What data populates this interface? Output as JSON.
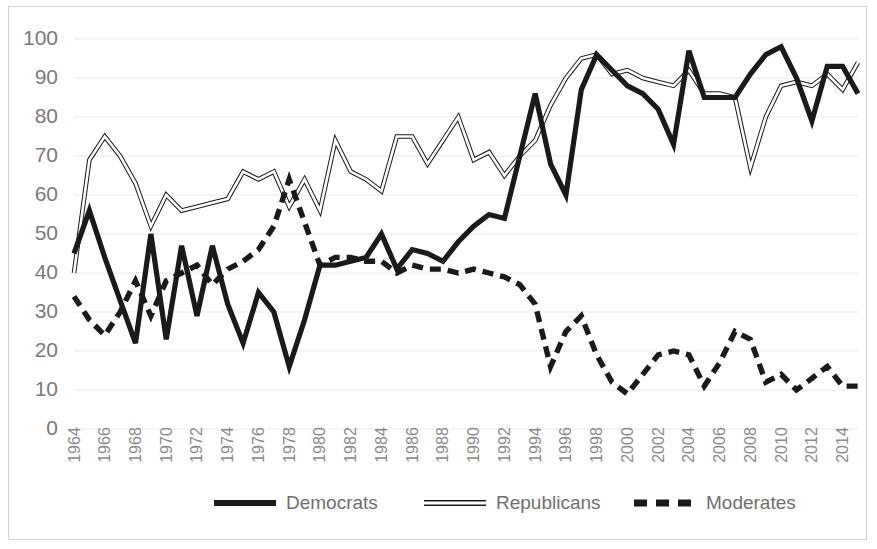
{
  "chart_data": {
    "type": "line",
    "title": "",
    "subtitle": "",
    "xlabel": "",
    "ylabel": "",
    "xlim": [
      1964,
      2015
    ],
    "ylim": [
      0,
      100
    ],
    "grid": true,
    "legend_position": "bottom",
    "y_ticks": [
      0,
      10,
      20,
      30,
      40,
      50,
      60,
      70,
      80,
      90,
      100
    ],
    "x_tick_labels": [
      "1964",
      "1966",
      "1968",
      "1970",
      "1972",
      "1974",
      "1976",
      "1978",
      "1980",
      "1982",
      "1984",
      "1986",
      "1988",
      "1990",
      "1992",
      "1994",
      "1996",
      "1998",
      "2000",
      "2002",
      "2004",
      "2006",
      "2008",
      "2010",
      "2012",
      "2014"
    ],
    "x": [
      1964,
      1965,
      1966,
      1967,
      1968,
      1969,
      1970,
      1971,
      1972,
      1973,
      1974,
      1975,
      1976,
      1977,
      1978,
      1979,
      1980,
      1981,
      1982,
      1983,
      1984,
      1985,
      1986,
      1987,
      1988,
      1989,
      1990,
      1991,
      1992,
      1993,
      1994,
      1995,
      1996,
      1997,
      1998,
      1999,
      2000,
      2001,
      2002,
      2003,
      2004,
      2005,
      2006,
      2007,
      2008,
      2009,
      2010,
      2011,
      2012,
      2013,
      2014,
      2015
    ],
    "series": [
      {
        "name": "Democrats",
        "style": "solid-thick",
        "color": "#1a1a1a",
        "values": [
          45,
          56,
          44,
          33,
          22,
          50,
          23,
          47,
          29,
          47,
          32,
          22,
          35,
          30,
          16,
          28,
          42,
          42,
          43,
          44,
          50,
          41,
          46,
          45,
          43,
          48,
          52,
          55,
          54,
          70,
          86,
          68,
          60,
          87,
          96,
          92,
          88,
          86,
          82,
          73,
          97,
          85,
          85,
          85,
          91,
          96,
          98,
          90,
          79,
          93,
          93,
          86
        ]
      },
      {
        "name": "Republicans",
        "style": "solid-thin-outline",
        "color": "#1a1a1a",
        "values": [
          40,
          69,
          75,
          70,
          63,
          52,
          60,
          56,
          57,
          58,
          59,
          66,
          64,
          66,
          57,
          64,
          56,
          74,
          66,
          64,
          61,
          75,
          75,
          68,
          74,
          80,
          69,
          71,
          65,
          70,
          74,
          83,
          90,
          95,
          96,
          91,
          92,
          90,
          89,
          88,
          92,
          86,
          86,
          85,
          67,
          80,
          88,
          89,
          88,
          91,
          87,
          94
        ]
      },
      {
        "name": "Moderates",
        "style": "dashed-thick",
        "color": "#1a1a1a",
        "values": [
          34,
          28,
          24,
          30,
          38,
          29,
          38,
          40,
          42,
          37,
          41,
          43,
          46,
          52,
          64,
          53,
          42,
          44,
          44,
          43,
          43,
          40,
          42,
          41,
          41,
          40,
          41,
          40,
          39,
          37,
          32,
          16,
          25,
          29,
          19,
          12,
          9,
          14,
          19,
          20,
          19,
          11,
          17,
          25,
          23,
          12,
          14,
          10,
          13,
          16,
          11,
          11
        ]
      }
    ]
  },
  "legend": {
    "items": [
      {
        "label": "Democrats",
        "marker": "solid-thick-line"
      },
      {
        "label": "Republicans",
        "marker": "hollow-thin-line"
      },
      {
        "label": "Moderates",
        "marker": "dashed-thick-line"
      }
    ]
  },
  "colors": {
    "series_line": "#1a1a1a",
    "gridline": "#e9e9e9",
    "tick_text": "#7a7a7a",
    "border": "#d4d4d4"
  }
}
